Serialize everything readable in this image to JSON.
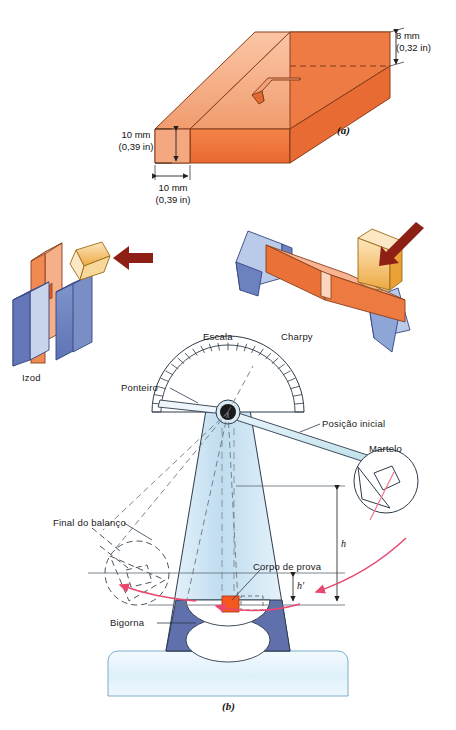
{
  "figure": {
    "title_a": "(a)",
    "title_b": "(b)",
    "language": "pt-BR",
    "panel_a": {
      "name": "notched-impact-test-specimen",
      "dimensions": [
        {
          "key": "height_right",
          "metric": "8 mm",
          "imperial": "(0,32 in)"
        },
        {
          "key": "height_left",
          "metric": "10 mm",
          "imperial": "(0,39 in)"
        },
        {
          "key": "width_left",
          "metric": "10 mm",
          "imperial": "(0,39 in)"
        }
      ]
    },
    "panel_tests": {
      "izod_label": "Izod",
      "charpy_label": "Charpy"
    },
    "panel_b": {
      "labels": {
        "scale": "Escala",
        "pointer": "Ponteiro",
        "start_position": "Posição inicial",
        "hammer": "Martelo",
        "end_of_swing": "Final do balanço",
        "specimen": "Corpo de prova",
        "anvil": "Bigorna",
        "height_initial": "h",
        "height_final": "h'"
      }
    }
  },
  "colors": {
    "specimen_top": "#f6a982",
    "specimen_front": "#ee7742",
    "specimen_side": "#e2652f",
    "outline": "#7d3a18",
    "vise_blue": "#6c82c0",
    "vise_blue_top": "#c8d4ec",
    "hammer_tan": "#f0b860",
    "hammer_tan_light": "#fbe0b0",
    "arrow_dark_red": "#8e1f14",
    "tower_blue": "#cfe5f4",
    "anvil_blue": "#5f70ad",
    "base_blue": "#dff0fa",
    "swing_arrow_pink": "#e8486e",
    "line": "#2d3a4a"
  }
}
